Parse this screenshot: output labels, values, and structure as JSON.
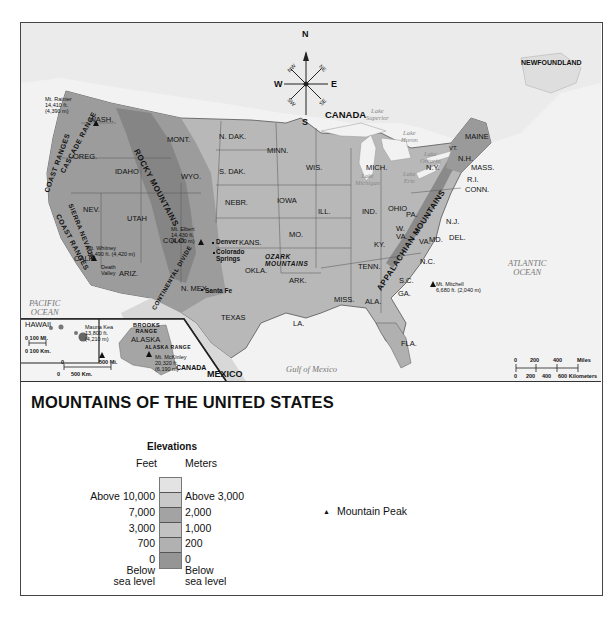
{
  "title": "MOUNTAINS OF THE UNITED STATES",
  "legend": {
    "heading": "Elevations",
    "feet_header": "Feet",
    "meters_header": "Meters",
    "bands": [
      {
        "color": "#e3e3e3"
      },
      {
        "color": "#c9c9c9"
      },
      {
        "color": "#a3a3a3"
      },
      {
        "color": "#c2c2c2"
      },
      {
        "color": "#b1b1b1"
      },
      {
        "color": "#959595"
      }
    ],
    "feet_labels": [
      "Above 10,000",
      "7,000",
      "3,000",
      "700",
      "0",
      "Below",
      "sea level"
    ],
    "meter_labels": [
      "Above 3,000",
      "2,000",
      "1,000",
      "200",
      "0",
      "Below",
      "sea level"
    ],
    "peak_symbol": "▲",
    "peak_label": "Mountain Peak"
  },
  "compass": {
    "n": "N",
    "s": "S",
    "e": "E",
    "w": "W",
    "ne": "NE",
    "nw": "NW",
    "se": "SE",
    "sw": "SW"
  },
  "map": {
    "countries": {
      "canada": "CANADA",
      "mexico": "MEXICO",
      "newfoundland": "NEWFOUNDLAND",
      "canada_inset": "CANADA"
    },
    "oceans": {
      "pacific": "PACIFIC\nOCEAN",
      "atlantic": "ATLANTIC\nOCEAN",
      "gulf": "Gulf of Mexico"
    },
    "lakes": {
      "superior": "Lake\nSuperior",
      "huron": "Lake\nHuron",
      "ontario": "Lake\nOntario",
      "michigan": "Lake\nMichigan",
      "erie": "Lake\nErie"
    },
    "states": {
      "wash": "WASH.",
      "oreg": "OREG.",
      "idaho": "IDAHO",
      "mont": "MONT.",
      "wyo": "WYO.",
      "nev": "NEV.",
      "utah": "UTAH",
      "colo": "COLO.",
      "calif": "CALIF.",
      "ariz": "ARIZ.",
      "nmex": "N. MEX.",
      "ndak": "N. DAK.",
      "sdak": "S. DAK.",
      "nebr": "NEBR.",
      "kans": "KANS.",
      "okla": "OKLA.",
      "texas": "TEXAS",
      "minn": "MINN.",
      "iowa": "IOWA",
      "mo": "MO.",
      "ark": "ARK.",
      "la": "LA.",
      "wis": "WIS.",
      "ill": "ILL.",
      "mich": "MICH.",
      "ind": "IND.",
      "ohio": "OHIO",
      "ky": "KY.",
      "tenn": "TENN.",
      "miss": "MISS.",
      "ala": "ALA.",
      "ga": "GA.",
      "fla": "FLA.",
      "sc": "S.C.",
      "nc": "N.C.",
      "va": "VA.",
      "wva": "W.\nVA.",
      "md": "MD.",
      "del": "DEL.",
      "nj": "N.J.",
      "pa": "PA.",
      "ny": "N.Y.",
      "vt": "VT.",
      "nh": "N.H.",
      "mass": "MASS.",
      "ri": "R.I.",
      "conn": "CONN.",
      "maine": "MAINE",
      "hawaii": "HAWAII",
      "alaska": "ALASKA"
    },
    "ranges": {
      "rocky": "ROCKY MOUNTAINS",
      "cascade": "CASCADE RANGE",
      "coast_n": "COAST RANGES",
      "coast_s": "COAST RANGES",
      "sierra": "SIERRA NEVADA",
      "continental": "CONTINENTAL DIVIDE",
      "ozark": "OZARK\nMOUNTAINS",
      "appalachian": "APPALACHIAN MOUNTAINS",
      "brooks": "BROOKS\nRANGE",
      "alaska_range": "ALASKA RANGE"
    },
    "cities": {
      "denver": "Denver",
      "colorado_springs": "Colorado\nSprings",
      "santa_fe": "Santa Fe"
    },
    "peaks": {
      "rainier": "Mt. Rainier\n14,410 ft.\n(4,390 m)",
      "whitney": "Mt. Whitney\n14,490 ft. (4,420 m)",
      "elbert": "Mt. Elbert\n14,430 ft.\n(4,400 m)",
      "mitchell": "Mt. Mitchell\n6,680 ft. (2,040 m)",
      "mauna_kea": "Mauna Kea\n13,800 ft.\n(4,210 m)",
      "mckinley": "Mt. McKinley\n20,320 ft.\n(6,190 m)"
    },
    "places": {
      "death_valley": "Death\nValley"
    },
    "scale_main": {
      "miles": [
        "0",
        "200",
        "400",
        "Miles"
      ],
      "km": [
        "0",
        "200",
        "400",
        "600 Kilometers"
      ]
    },
    "scale_hawaii": {
      "miles": "0    100 MI.",
      "km": "0 100 Km."
    },
    "scale_alaska": {
      "miles": [
        "0",
        "500 Mi."
      ],
      "km": [
        "0",
        "500 Km."
      ]
    }
  }
}
